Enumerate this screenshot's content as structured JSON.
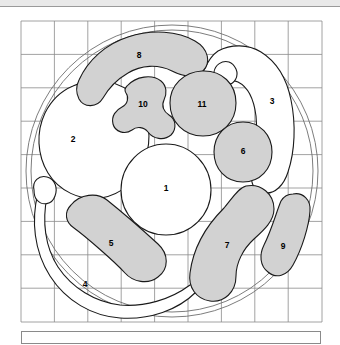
{
  "figure": {
    "title": "",
    "caption": "",
    "background_color": "#ffffff",
    "fill_gray": "#d2d2d2",
    "stroke_color": "#1a1a1a",
    "grid_color": "#8a8a8a"
  },
  "grid": {
    "columns": 9,
    "rows": 9,
    "x0": 21,
    "y0": 13,
    "x1": 322,
    "y1": 314,
    "visible": true
  },
  "outer_circle": {
    "cx": 172,
    "cy": 163,
    "r": 145,
    "inner_r": 140,
    "label": "perimeter"
  },
  "regions": [
    {
      "id": 1,
      "label": "1",
      "fill": "white",
      "cx": 166,
      "cy": 181
    },
    {
      "id": 2,
      "label": "2",
      "fill": "white",
      "cx": 73,
      "cy": 132
    },
    {
      "id": 3,
      "label": "3",
      "fill": "white",
      "cx": 272,
      "cy": 94
    },
    {
      "id": 4,
      "label": "4",
      "fill": "white",
      "cx": 85,
      "cy": 277
    },
    {
      "id": 5,
      "label": "5",
      "fill": "gray",
      "cx": 111,
      "cy": 236
    },
    {
      "id": 6,
      "label": "6",
      "fill": "gray",
      "cx": 243,
      "cy": 144
    },
    {
      "id": 7,
      "label": "7",
      "fill": "gray",
      "cx": 227,
      "cy": 238
    },
    {
      "id": 8,
      "label": "8",
      "fill": "gray",
      "cx": 139,
      "cy": 48
    },
    {
      "id": 9,
      "label": "9",
      "fill": "gray",
      "cx": 283,
      "cy": 239
    },
    {
      "id": 10,
      "label": "10",
      "fill": "gray",
      "cx": 143,
      "cy": 97
    },
    {
      "id": 11,
      "label": "11",
      "fill": "gray",
      "cx": 202,
      "cy": 97
    }
  ],
  "caption_box": {
    "text": ""
  }
}
